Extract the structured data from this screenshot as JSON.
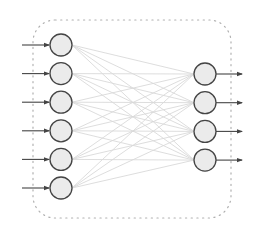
{
  "diagram": {
    "type": "neural-network",
    "layers": [
      {
        "name": "input",
        "node_count": 6
      },
      {
        "name": "output",
        "node_count": 4
      }
    ],
    "connection": "fully-connected",
    "colors": {
      "node_fill": "#ebebeb",
      "node_stroke": "#444444",
      "edge": "#d9d9d9",
      "arrow": "#444444",
      "border": "#b0b0b0"
    }
  }
}
